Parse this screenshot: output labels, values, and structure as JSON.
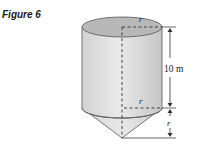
{
  "figure": {
    "title": "Figure 6",
    "shape": "cylinder-on-cone",
    "labels": {
      "top_radius": "r",
      "bottom_radius": "r",
      "cylinder_height": "10 m",
      "cone_height": "r"
    },
    "colors": {
      "top_face": "#b9b9b9",
      "side_light": "#e6e6e6",
      "side_dark": "#c8c8c8",
      "cone_light": "#e2e2e2",
      "cone_dark": "#cfcfcf",
      "outline": "#444444"
    }
  }
}
